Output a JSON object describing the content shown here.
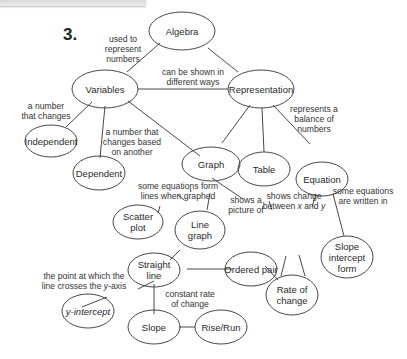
{
  "problem_number": "3.",
  "nodes": {
    "algebra": {
      "label": "Algebra"
    },
    "variables": {
      "label": "Variables"
    },
    "representation": {
      "label": "Representation"
    },
    "independent": {
      "label": "Independent"
    },
    "dependent": {
      "label": "Dependent"
    },
    "graph": {
      "label": "Graph"
    },
    "table": {
      "label": "Table"
    },
    "equation": {
      "label": "Equation"
    },
    "scatter_plot": {
      "line1": "Scatter",
      "line2": "plot"
    },
    "line_graph": {
      "line1": "Line",
      "line2": "graph"
    },
    "rate_of_change": {
      "line1": "Rate of",
      "line2": "change"
    },
    "slope_intercept_form": {
      "line1": "Slope",
      "line2": "intercept",
      "line3": "form"
    },
    "straight_line": {
      "line1": "Straight",
      "line2": "line"
    },
    "ordered_pair": {
      "label": "Ordered pair"
    },
    "y_intercept": {
      "label": "y-intercept"
    },
    "slope": {
      "label": "Slope"
    },
    "rise_run": {
      "label": "Rise/Run"
    }
  },
  "edge_labels": {
    "used_to_represent": {
      "line1": "used to",
      "line2": "represent",
      "line3": "numbers"
    },
    "can_be_shown": {
      "line1": "can be shown in",
      "line2": "different ways"
    },
    "number_that_changes": {
      "line1": "a number",
      "line2": "that changes"
    },
    "changes_based": {
      "line1": "a number that",
      "line2": "changes based",
      "line3": "on another"
    },
    "represents_balance": {
      "line1": "represents a",
      "line2": "balance of",
      "line3": "numbers"
    },
    "equations_form_lines": {
      "line1": "some equations form",
      "line2": "lines when graphed"
    },
    "shows_picture": {
      "line1": "shows a",
      "line2": "picture of"
    },
    "shows_change": {
      "line1": "shows change",
      "line2a": "between ",
      "x": "x",
      "and": " and ",
      "y": "y"
    },
    "written_in": {
      "line1": "some equations",
      "line2": "are written in"
    },
    "point_crosses": {
      "line1": "the point at which the",
      "line2a": "line crosses the ",
      "y": "y",
      "line2b": "-axis"
    },
    "constant_rate": {
      "line1": "constant rate",
      "line2": "of change"
    }
  },
  "colors": {
    "stroke": "#333333",
    "text": "#2a2a2a",
    "background": "#ffffff"
  }
}
